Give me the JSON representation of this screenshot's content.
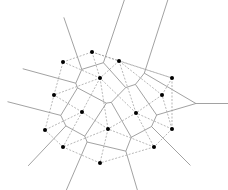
{
  "diagram": {
    "type": "voronoi-delaunay",
    "colors": {
      "background": "#ffffff",
      "site": "#000000",
      "voronoi_edge": "#8a8a8a",
      "delaunay_edge": "#9a9a9a"
    },
    "ray_length": 55,
    "sites": [
      {
        "id": 1,
        "x": 92,
        "y": 52
      },
      {
        "id": 2,
        "x": 63,
        "y": 62
      },
      {
        "id": 3,
        "x": 119,
        "y": 61
      },
      {
        "id": 4,
        "x": 100,
        "y": 78
      },
      {
        "id": 5,
        "x": 172,
        "y": 78
      },
      {
        "id": 6,
        "x": 54,
        "y": 95
      },
      {
        "id": 7,
        "x": 162,
        "y": 95
      },
      {
        "id": 8,
        "x": 82,
        "y": 112
      },
      {
        "id": 9,
        "x": 136,
        "y": 113
      },
      {
        "id": 10,
        "x": 45,
        "y": 130
      },
      {
        "id": 11,
        "x": 108,
        "y": 129
      },
      {
        "id": 12,
        "x": 172,
        "y": 129
      },
      {
        "id": 13,
        "x": 63,
        "y": 147
      },
      {
        "id": 14,
        "x": 154,
        "y": 147
      },
      {
        "id": 15,
        "x": 100,
        "y": 163
      }
    ]
  }
}
